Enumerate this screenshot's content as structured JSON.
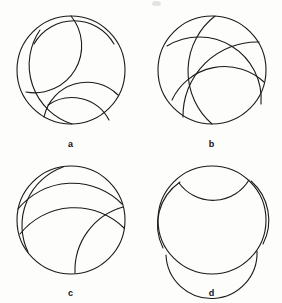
{
  "figure": {
    "title": "",
    "background_color": "#fdfdfc",
    "stroke_color": "#1a1a1a",
    "stroke_width": 1.1,
    "panels": [
      {
        "id": "a",
        "label": "a",
        "description": "Poincare disk with three geodesic arcs meeting near the top and three near the bottom",
        "circle": {
          "cx": 71,
          "cy": 70,
          "r": 54
        },
        "arcs": [
          {
            "name": "arc-a-1",
            "d": "M 71 16 A 47 47 0 0 1 26 92"
          },
          {
            "name": "arc-a-2",
            "d": "M 34 44 A 46 46 0 0 1 114 44"
          },
          {
            "name": "arc-a-3",
            "d": "M 40 30 A 62 62 0 0 0 72 124"
          },
          {
            "name": "arc-a-4",
            "d": "M 118 95 A 44 44 0 0 0 44 117"
          },
          {
            "name": "arc-a-5",
            "d": "M 109 120 A 42 42 0 0 0 48 105"
          }
        ]
      },
      {
        "id": "b",
        "label": "b",
        "description": "Poincare disk with four long geodesic arcs crossing the interior",
        "circle": {
          "cx": 71,
          "cy": 70,
          "r": 54
        },
        "arcs": [
          {
            "name": "arc-b-1",
            "d": "M 74 16 A 70 70 0 0 0 71 124"
          },
          {
            "name": "arc-b-2",
            "d": "M 26 46 A 62 62 0 0 1 120 104"
          },
          {
            "name": "arc-b-3",
            "d": "M 118 42 A 74 74 0 0 0 42 117"
          },
          {
            "name": "arc-b-4",
            "d": "M 123 82 A 58 58 0 0 0 31 100"
          }
        ]
      },
      {
        "id": "c",
        "label": "c",
        "description": "Poincare disk with four geodesic arcs forming a central quadrilateral region",
        "circle": {
          "cx": 71,
          "cy": 68,
          "r": 54
        },
        "arcs": [
          {
            "name": "arc-c-1",
            "d": "M 63 15 A 62 62 0 0 0 28 100"
          },
          {
            "name": "arc-c-2",
            "d": "M 18 57 A 70 70 0 0 1 122 52"
          },
          {
            "name": "arc-c-3",
            "d": "M 123 55 A 66 66 0 0 0 75 121"
          },
          {
            "name": "arc-c-4",
            "d": "M 20 82 A 70 70 0 0 1 124 76"
          }
        ]
      },
      {
        "id": "d",
        "label": "d",
        "description": "Poincare disk with four geodesic arcs cutting off four corner regions, leaving a central cross shape",
        "circle": {
          "cx": 71,
          "cy": 68,
          "r": 54
        },
        "arcs": [
          {
            "name": "arc-d-1",
            "d": "M 38 31 A 42 42 0 0 0 108 28"
          },
          {
            "name": "arc-d-2",
            "d": "M 39 30 A 52 52 0 0 0 22 96"
          },
          {
            "name": "arc-d-3",
            "d": "M 110 29 A 52 52 0 0 1 122 92"
          },
          {
            "name": "arc-d-4",
            "d": "M 25 103 A 44 44 0 0 0 116 99"
          }
        ]
      }
    ]
  }
}
